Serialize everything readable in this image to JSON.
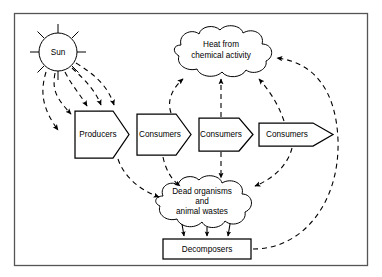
{
  "diagram": {
    "frame": {
      "stroke": "#555555",
      "fill": "#ffffff"
    },
    "ink": "#000000",
    "sun": {
      "label": "Sun",
      "cx": 58,
      "cy": 52,
      "r": 19,
      "ray_count": 8
    },
    "trophic_chain": [
      {
        "id": "producers",
        "label": "Producers",
        "x": 75,
        "y": 111,
        "w": 54,
        "h": 47,
        "tip": 16
      },
      {
        "id": "consumers-1",
        "label": "Consumers",
        "x": 137,
        "y": 114,
        "w": 54,
        "h": 41,
        "tip": 15
      },
      {
        "id": "consumers-2",
        "label": "Consumers",
        "x": 199,
        "y": 118,
        "w": 54,
        "h": 33,
        "tip": 14
      },
      {
        "id": "consumers-3",
        "label": "Consumers",
        "x": 259,
        "y": 123,
        "w": 54,
        "h": 23,
        "tip": 20
      }
    ],
    "clouds": [
      {
        "id": "heat-cloud",
        "lines": [
          "Heat from",
          "chemical activity"
        ],
        "cx": 221,
        "cy": 52,
        "rx": 57,
        "ry": 22
      },
      {
        "id": "dead-organisms-cloud",
        "lines": [
          "Dead organisms",
          "and",
          "animal wastes"
        ],
        "cx": 202,
        "cy": 203,
        "rx": 54,
        "ry": 24
      }
    ],
    "decomposers": {
      "id": "decomposers",
      "label": "Decomposers",
      "x": 163,
      "y": 239,
      "w": 88,
      "h": 20
    },
    "flows": {
      "sun_to_producers": {
        "count": 5,
        "style": "dashed",
        "label": "solar energy input"
      },
      "chain_transfer": {
        "style": "solid",
        "label": "energy transfer along food chain"
      },
      "heat_loss": {
        "count": 4,
        "style": "dashed",
        "label": "heat lost to chemical activity"
      },
      "to_dead_organisms": {
        "count": 4,
        "style": "dashed",
        "label": "dead matter and wastes"
      },
      "dead_to_decomposers": {
        "count": 3,
        "style": "solid",
        "label": "decomposition"
      },
      "decomposers_to_heat": {
        "count": 1,
        "style": "dashed",
        "label": "heat from decomposers"
      }
    }
  }
}
